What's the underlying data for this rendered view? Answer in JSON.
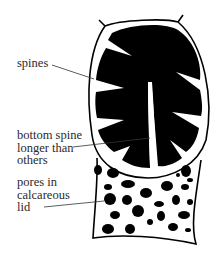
{
  "diagram": {
    "colors": {
      "ink": "#000000",
      "fill": "#ffffff",
      "text": "#2a2a2a"
    },
    "labels": [
      {
        "id": "spines",
        "lines": [
          "spines"
        ]
      },
      {
        "id": "bottom-spine",
        "lines": [
          "bottom spine",
          "longer than",
          "others"
        ]
      },
      {
        "id": "pores",
        "lines": [
          "pores in",
          "calcareous",
          "lid"
        ]
      }
    ]
  }
}
